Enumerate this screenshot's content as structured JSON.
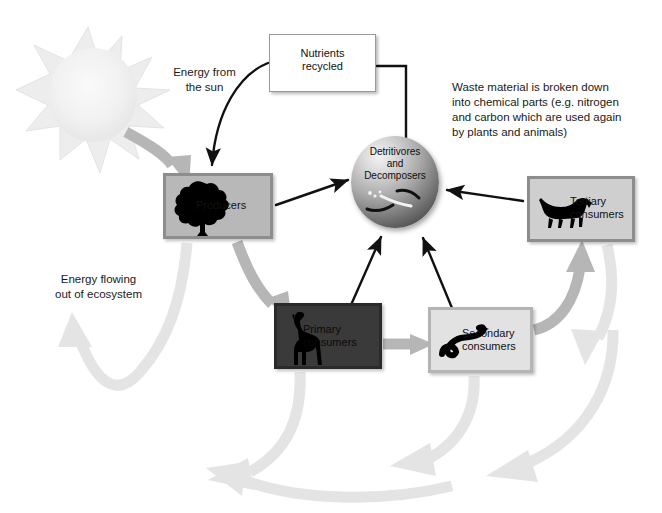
{
  "diagram": {
    "background_color": "#ffffff"
  },
  "captions": {
    "energy_from_sun": "Energy from\nthe sun",
    "waste_material": "Waste material is broken down\ninto chemical parts (e.g. nitrogen\nand carbon which are used again\nby plants and animals)",
    "energy_out": "Energy flowing\nout of ecosystem"
  },
  "nodes": {
    "nutrients": {
      "label": "Nutrients\nrecycled",
      "fill": "#ffffff",
      "border": "#9a9a9a",
      "icon": "none"
    },
    "producers": {
      "label": "Producers",
      "fill": "#b8b8b8",
      "border": "#8d8d8d",
      "icon": "tree-icon"
    },
    "primary_consumers": {
      "label": "Primary\nconsumers",
      "fill": "#3a3a3a",
      "border": "#2a2a2a",
      "icon": "giraffe-icon"
    },
    "secondary_consumers": {
      "label": "Secondary\nconsumers",
      "fill": "#e2e2e2",
      "border": "#b4b4b4",
      "icon": "snake-icon"
    },
    "tertiary_consumers": {
      "label": "Tertiary\nconsumers",
      "fill": "#cfcfcf",
      "border": "#8d8d8d",
      "icon": "fox-icon"
    },
    "detritivores": {
      "label": "Detritivores\nand\nDecomposers",
      "fill": "radial-gradient-sphere",
      "icon": "worms-icon"
    },
    "sun": {
      "label": "",
      "fill": "#efefef",
      "icon": "sun-icon"
    }
  },
  "edges": {
    "black_arrows": [
      {
        "name": "nutrients-to-producers",
        "from": "nutrients",
        "to": "producers",
        "style": "curved-black-arrow"
      },
      {
        "name": "nutrients-to-detritivores",
        "from": "detritivores",
        "to": "nutrients",
        "style": "elbow-black-line"
      },
      {
        "name": "producers-to-detritivores",
        "from": "producers",
        "to": "detritivores",
        "style": "straight-black-arrow"
      },
      {
        "name": "primary-to-detritivores",
        "from": "primary_consumers",
        "to": "detritivores",
        "style": "straight-black-arrow"
      },
      {
        "name": "secondary-to-detritivores",
        "from": "secondary_consumers",
        "to": "detritivores",
        "style": "straight-black-arrow"
      },
      {
        "name": "tertiary-to-detritivores",
        "from": "tertiary_consumers",
        "to": "detritivores",
        "style": "straight-black-arrow"
      }
    ],
    "grey_energy_arrows": [
      {
        "name": "sun-to-producers",
        "from": "sun",
        "to": "producers",
        "tone": "#b6b6b6"
      },
      {
        "name": "producers-to-primary",
        "from": "producers",
        "to": "primary_consumers",
        "tone": "#b6b6b6"
      },
      {
        "name": "primary-to-secondary",
        "from": "primary_consumers",
        "to": "secondary_consumers",
        "tone": "#b6b6b6"
      },
      {
        "name": "secondary-to-tertiary",
        "from": "secondary_consumers",
        "to": "tertiary_consumers",
        "tone": "#b6b6b6"
      }
    ],
    "energy_loss_arrows": [
      {
        "name": "producers-energy-loss",
        "from": "producers",
        "tone": "#e4e4e4"
      },
      {
        "name": "primary-energy-loss",
        "from": "primary_consumers",
        "tone": "#e4e4e4"
      },
      {
        "name": "secondary-energy-loss",
        "from": "secondary_consumers",
        "tone": "#e4e4e4"
      },
      {
        "name": "tertiary-energy-loss",
        "from": "tertiary_consumers",
        "tone": "#e4e4e4"
      },
      {
        "name": "bottom-energy-loss-sweep",
        "from": "ecosystem",
        "tone": "#e4e4e4"
      }
    ]
  },
  "colors": {
    "black_arrow": "#111111",
    "grey_arrow": "#b6b6b6",
    "pale_arrow": "#e4e4e4",
    "sun": "#efefef",
    "text": "#1a1a1a"
  }
}
